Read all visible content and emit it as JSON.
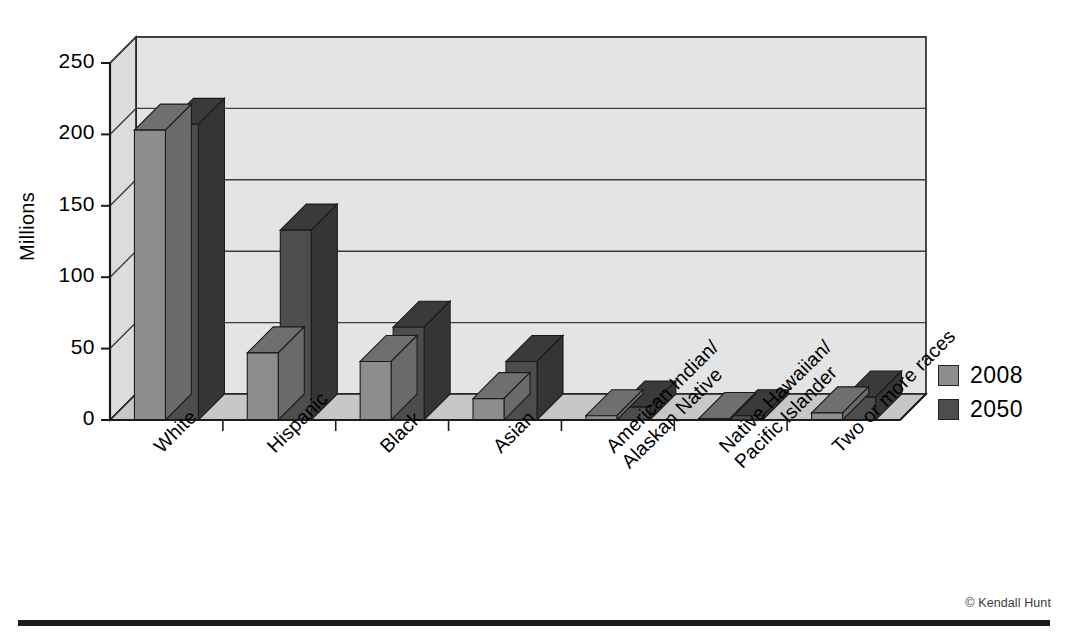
{
  "chart_data": {
    "type": "bar",
    "title": "",
    "subtitle": "",
    "xlabel": "",
    "ylabel": "Millions",
    "ylim": [
      0,
      250
    ],
    "yticks": [
      0,
      50,
      100,
      150,
      200,
      250
    ],
    "ytick_labels": [
      "0",
      "50",
      "100",
      "150",
      "200",
      "250"
    ],
    "grid": true,
    "grid_orientation": "horizontal",
    "legend_position": "right",
    "three_d": true,
    "categories": [
      "White",
      "Hispanic",
      "Black",
      "Asian",
      "American Indian/ Alaskan Native",
      "Native Hawaiian/ Pacific Islander",
      "Two or more races"
    ],
    "category_lines": [
      [
        "White"
      ],
      [
        "Hispanic"
      ],
      [
        "Black"
      ],
      [
        "Asian"
      ],
      [
        "American Indian/",
        "Alaskan Native"
      ],
      [
        "Native Hawaiian/",
        "Pacific Islander"
      ],
      [
        "Two or more races"
      ]
    ],
    "series": [
      {
        "name": "2008",
        "color": "#8d8d8d",
        "values": [
          203,
          47,
          41,
          15,
          3,
          1,
          5
        ]
      },
      {
        "name": "2050",
        "color": "#4d4d4d",
        "values": [
          207,
          133,
          65,
          41,
          9,
          3,
          16
        ]
      }
    ]
  },
  "legend": {
    "items": [
      {
        "label": "2008",
        "color": "#8d8d8d"
      },
      {
        "label": "2050",
        "color": "#4d4d4d"
      }
    ]
  },
  "axis": {
    "y_title": "Millions"
  },
  "footer": {
    "credit": "© Kendall Hunt"
  },
  "colors": {
    "back_wall": "#e4e4e4",
    "side_wall": "#dcdcdc",
    "floor": "#c7c7c7",
    "axis_line": "#1c1c1c",
    "grid_line": "#3c3c3c",
    "series_2008_front": "#8d8d8d",
    "series_2008_top": "#6f6f6f",
    "series_2008_side": "#6a6a6a",
    "series_2050_front": "#4d4d4d",
    "series_2050_top": "#3a3a3a",
    "series_2050_side": "#353535",
    "footer_rule": "#1b1b1b"
  }
}
